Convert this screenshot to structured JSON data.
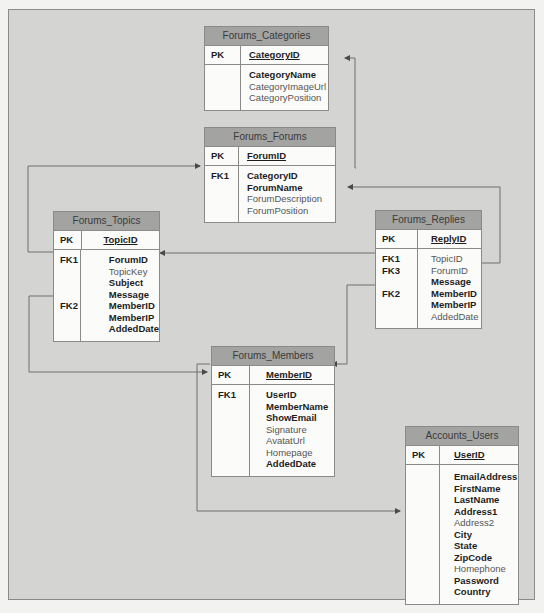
{
  "diagram": {
    "tables": {
      "categories": {
        "name": "Forums_Categories",
        "pk_label": "PK",
        "pk_field": "CategoryID",
        "keys": [
          "",
          "",
          ""
        ],
        "fields": [
          {
            "name": "CategoryName",
            "bold": true
          },
          {
            "name": "CategoryImageUrl",
            "bold": false
          },
          {
            "name": "CategoryPosition",
            "bold": false
          }
        ]
      },
      "forums": {
        "name": "Forums_Forums",
        "pk_label": "PK",
        "pk_field": "ForumID",
        "keys": [
          "FK1",
          "",
          "",
          ""
        ],
        "fields": [
          {
            "name": "CategoryID",
            "bold": true
          },
          {
            "name": "ForumName",
            "bold": true
          },
          {
            "name": "ForumDescription",
            "bold": false
          },
          {
            "name": "ForumPosition",
            "bold": false
          }
        ]
      },
      "topics": {
        "name": "Forums_Topics",
        "pk_label": "PK",
        "pk_field": "TopicID",
        "keys": [
          "FK1",
          "",
          "",
          "",
          "FK2",
          "",
          ""
        ],
        "fields": [
          {
            "name": "ForumID",
            "bold": true
          },
          {
            "name": "TopicKey",
            "bold": false
          },
          {
            "name": "Subject",
            "bold": true
          },
          {
            "name": "Message",
            "bold": true
          },
          {
            "name": "MemberID",
            "bold": true
          },
          {
            "name": "MemberIP",
            "bold": true
          },
          {
            "name": "AddedDate",
            "bold": true
          }
        ]
      },
      "replies": {
        "name": "Forums_Replies",
        "pk_label": "PK",
        "pk_field": "ReplyID",
        "keys": [
          "FK1",
          "FK3",
          "",
          "FK2",
          "",
          ""
        ],
        "fields": [
          {
            "name": "TopicID",
            "bold": false
          },
          {
            "name": "ForumID",
            "bold": false
          },
          {
            "name": "Message",
            "bold": true
          },
          {
            "name": "MemberID",
            "bold": true
          },
          {
            "name": "MemberIP",
            "bold": true
          },
          {
            "name": "AddedDate",
            "bold": false
          }
        ]
      },
      "members": {
        "name": "Forums_Members",
        "pk_label": "PK",
        "pk_field": "MemberID",
        "keys": [
          "FK1",
          "",
          "",
          "",
          "",
          "",
          ""
        ],
        "fields": [
          {
            "name": "UserID",
            "bold": true
          },
          {
            "name": "MemberName",
            "bold": true
          },
          {
            "name": "ShowEmail",
            "bold": true
          },
          {
            "name": "Signature",
            "bold": false
          },
          {
            "name": "AvatatUrl",
            "bold": false
          },
          {
            "name": "Homepage",
            "bold": false
          },
          {
            "name": "AddedDate",
            "bold": true
          }
        ]
      },
      "users": {
        "name": "Accounts_Users",
        "pk_label": "PK",
        "pk_field": "UserID",
        "keys": [
          "",
          "",
          "",
          "",
          "",
          "",
          "",
          "",
          "",
          "",
          ""
        ],
        "fields": [
          {
            "name": "EmailAddress",
            "bold": true
          },
          {
            "name": "FirstName",
            "bold": true
          },
          {
            "name": "LastName",
            "bold": true
          },
          {
            "name": "Address1",
            "bold": true
          },
          {
            "name": "Address2",
            "bold": false
          },
          {
            "name": "City",
            "bold": true
          },
          {
            "name": "State",
            "bold": true
          },
          {
            "name": "ZipCode",
            "bold": true
          },
          {
            "name": "Homephone",
            "bold": false
          },
          {
            "name": "Password",
            "bold": true
          },
          {
            "name": "Country",
            "bold": true
          }
        ]
      }
    },
    "relationships": [
      {
        "from": "Forums_Forums.CategoryID",
        "to": "Forums_Categories.CategoryID"
      },
      {
        "from": "Forums_Topics.ForumID",
        "to": "Forums_Forums.ForumID"
      },
      {
        "from": "Forums_Replies.ForumID",
        "to": "Forums_Forums.ForumID"
      },
      {
        "from": "Forums_Replies.TopicID",
        "to": "Forums_Topics.TopicID"
      },
      {
        "from": "Forums_Topics.MemberID",
        "to": "Forums_Members.MemberID"
      },
      {
        "from": "Forums_Replies.MemberID",
        "to": "Forums_Members.MemberID"
      },
      {
        "from": "Forums_Members.UserID",
        "to": "Accounts_Users.UserID"
      }
    ],
    "colors": {
      "background": "#d4d4d2",
      "header": "#a3a3a1",
      "table_body": "#fbfbfa",
      "line": "#6e6e6e"
    }
  }
}
